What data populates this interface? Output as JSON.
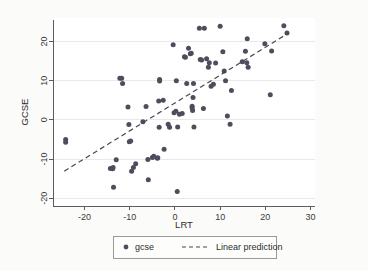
{
  "figure": {
    "background_color": "#fbfbfa",
    "plot_background_color": "#ffffff"
  },
  "chart_data": {
    "type": "scatter",
    "title": "",
    "subtitle": "",
    "xlabel": "LRT",
    "ylabel": "GCSE",
    "xlim": [
      -27,
      31
    ],
    "ylim": [
      -22,
      26
    ],
    "xticks": [
      -20,
      -10,
      0,
      10,
      20,
      30
    ],
    "xticklabels": [
      "-20",
      "-10",
      "0",
      "10",
      "20",
      "30"
    ],
    "yticks": [
      -20,
      -10,
      0,
      10,
      20
    ],
    "yticklabels": [
      "-20",
      "-10",
      "0",
      "10",
      "20"
    ],
    "grid": "horizontal",
    "legend_position": "bottom-outside",
    "marker_color": "#4d4d5c",
    "line_color": "#47474f",
    "series": [
      {
        "name": "gcse",
        "type": "scatter",
        "marker": "circle",
        "points": [
          [
            -24.2,
            -5.0
          ],
          [
            -24.2,
            -5.7
          ],
          [
            -14.3,
            -12.4
          ],
          [
            -13.8,
            -12.5
          ],
          [
            -13.7,
            -12.2
          ],
          [
            -13.6,
            -17.2
          ],
          [
            -13.0,
            -10.2
          ],
          [
            -12.2,
            10.6
          ],
          [
            -11.8,
            10.6
          ],
          [
            -11.6,
            9.3
          ],
          [
            -10.4,
            3.3
          ],
          [
            -10.2,
            -1.2
          ],
          [
            -10.1,
            -5.6
          ],
          [
            -9.8,
            -5.4
          ],
          [
            -9.6,
            -13.1
          ],
          [
            -9.2,
            -12.2
          ],
          [
            -8.7,
            -11.2
          ],
          [
            -7.1,
            -0.5
          ],
          [
            -6.4,
            3.4
          ],
          [
            -6.0,
            -10.1
          ],
          [
            -5.9,
            -15.3
          ],
          [
            -5.0,
            -9.6
          ],
          [
            -4.7,
            -9.3
          ],
          [
            -3.9,
            -9.8
          ],
          [
            -3.8,
            -9.7
          ],
          [
            -3.6,
            4.8
          ],
          [
            -3.5,
            -1.9
          ],
          [
            -3.4,
            10.3
          ],
          [
            -3.4,
            9.9
          ],
          [
            -2.6,
            5.0
          ],
          [
            -2.4,
            -7.5
          ],
          [
            -1.5,
            -1.1
          ],
          [
            -1.2,
            -1.9
          ],
          [
            -0.4,
            19.2
          ],
          [
            -0.2,
            1.8
          ],
          [
            0.2,
            2.2
          ],
          [
            0.3,
            10.0
          ],
          [
            0.5,
            -18.3
          ],
          [
            0.6,
            -1.8
          ],
          [
            1.0,
            1.4
          ],
          [
            1.6,
            1.6
          ],
          [
            2.1,
            16.1
          ],
          [
            2.3,
            16.0
          ],
          [
            2.6,
            9.3
          ],
          [
            3.0,
            18.3
          ],
          [
            3.4,
            16.9
          ],
          [
            3.6,
            17.0
          ],
          [
            3.8,
            3.5
          ],
          [
            3.8,
            3.0
          ],
          [
            3.9,
            2.4
          ],
          [
            4.0,
            5.7
          ],
          [
            4.1,
            9.3
          ],
          [
            4.2,
            -1.8
          ],
          [
            5.4,
            23.4
          ],
          [
            5.6,
            15.4
          ],
          [
            5.9,
            15.3
          ],
          [
            6.3,
            2.9
          ],
          [
            6.5,
            23.4
          ],
          [
            7.0,
            15.6
          ],
          [
            7.4,
            13.4
          ],
          [
            7.6,
            14.6
          ],
          [
            8.0,
            8.6
          ],
          [
            8.5,
            9.1
          ],
          [
            9.0,
            14.5
          ],
          [
            10.0,
            23.9
          ],
          [
            10.6,
            17.4
          ],
          [
            10.9,
            12.5
          ],
          [
            11.2,
            10.0
          ],
          [
            11.6,
            1.0
          ],
          [
            12.2,
            -1.1
          ],
          [
            12.5,
            7.5
          ],
          [
            14.9,
            14.8
          ],
          [
            15.6,
            17.5
          ],
          [
            15.9,
            14.6
          ],
          [
            16.2,
            13.4
          ],
          [
            16.0,
            20.7
          ],
          [
            19.9,
            19.4
          ],
          [
            21.1,
            6.4
          ],
          [
            21.4,
            17.6
          ],
          [
            24.1,
            24.0
          ],
          [
            24.8,
            22.2
          ]
        ]
      },
      {
        "name": "Linear prediction",
        "type": "line",
        "style": "dashed",
        "endpoints": [
          [
            -24.5,
            -13.1
          ],
          [
            25.2,
            22.2
          ]
        ],
        "slope": 0.711,
        "intercept": 4.31
      }
    ]
  },
  "legend": {
    "items": [
      {
        "label": "gcse",
        "glyph": "marker-dot"
      },
      {
        "label": "Linear prediction",
        "glyph": "dashed-line"
      }
    ]
  }
}
